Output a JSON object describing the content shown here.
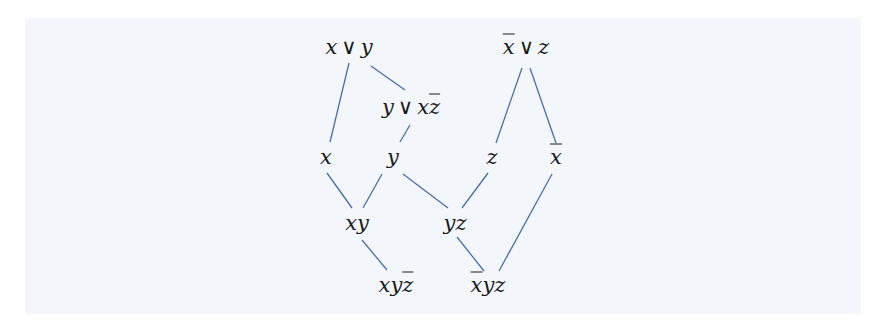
{
  "diagram": {
    "type": "hasse-diagram",
    "background_color": "#f3f7fb",
    "edge_color": "#4a6db0",
    "nodes": [
      {
        "id": "x_or_y",
        "parts": [
          {
            "t": "x"
          },
          {
            "op": "∨"
          },
          {
            "t": "y"
          }
        ],
        "label": "x ∨ y",
        "x": 349,
        "y": 47
      },
      {
        "id": "xbar_or_z",
        "parts": [
          {
            "t": "x",
            "bar": true
          },
          {
            "op": "∨"
          },
          {
            "t": "z"
          }
        ],
        "label": "x̄ ∨ z",
        "x": 526,
        "y": 47
      },
      {
        "id": "y_or_x_zbar",
        "parts": [
          {
            "t": "y"
          },
          {
            "op": "∨"
          },
          {
            "t": "x"
          },
          {
            "t": "z",
            "bar": true
          }
        ],
        "label": "y ∨ x z̄",
        "x": 411,
        "y": 107
      },
      {
        "id": "x",
        "parts": [
          {
            "t": "x"
          }
        ],
        "label": "x",
        "x": 326,
        "y": 157
      },
      {
        "id": "y",
        "parts": [
          {
            "t": "y"
          }
        ],
        "label": "y",
        "x": 393,
        "y": 157
      },
      {
        "id": "z",
        "parts": [
          {
            "t": "z"
          }
        ],
        "label": "z",
        "x": 492,
        "y": 157
      },
      {
        "id": "xbar",
        "parts": [
          {
            "t": "x",
            "bar": true
          }
        ],
        "label": "x̄",
        "x": 556,
        "y": 157
      },
      {
        "id": "xy",
        "parts": [
          {
            "t": "xy"
          }
        ],
        "label": "xy",
        "x": 357,
        "y": 223
      },
      {
        "id": "yz",
        "parts": [
          {
            "t": "yz"
          }
        ],
        "label": "yz",
        "x": 455,
        "y": 223
      },
      {
        "id": "xy_zbar",
        "parts": [
          {
            "t": "xy"
          },
          {
            "t": "z",
            "bar": true
          }
        ],
        "label": "xyz̄",
        "x": 396,
        "y": 285
      },
      {
        "id": "xbar_yz",
        "parts": [
          {
            "t": "x",
            "bar": true
          },
          {
            "t": "yz"
          }
        ],
        "label": "x̄yz",
        "x": 488,
        "y": 285
      }
    ],
    "edges": [
      {
        "from": "x_or_y",
        "to": "x",
        "x1": 349,
        "y1": 63,
        "x2": 330,
        "y2": 142
      },
      {
        "from": "x_or_y",
        "to": "y_or_x_zbar",
        "x1": 371,
        "y1": 66,
        "x2": 405,
        "y2": 90
      },
      {
        "from": "y_or_x_zbar",
        "to": "y",
        "x1": 410,
        "y1": 125,
        "x2": 400,
        "y2": 142
      },
      {
        "from": "xbar_or_z",
        "to": "z",
        "x1": 522,
        "y1": 68,
        "x2": 496,
        "y2": 143
      },
      {
        "from": "xbar_or_z",
        "to": "xbar",
        "x1": 530,
        "y1": 68,
        "x2": 556,
        "y2": 143
      },
      {
        "from": "x",
        "to": "xy",
        "x1": 327,
        "y1": 173,
        "x2": 352,
        "y2": 208
      },
      {
        "from": "y",
        "to": "xy",
        "x1": 382,
        "y1": 174,
        "x2": 363,
        "y2": 208
      },
      {
        "from": "y",
        "to": "yz",
        "x1": 403,
        "y1": 174,
        "x2": 448,
        "y2": 208
      },
      {
        "from": "z",
        "to": "yz",
        "x1": 488,
        "y1": 173,
        "x2": 462,
        "y2": 208
      },
      {
        "from": "xbar",
        "to": "xbar_yz",
        "x1": 552,
        "y1": 174,
        "x2": 499,
        "y2": 271
      },
      {
        "from": "xy",
        "to": "xy_zbar",
        "x1": 362,
        "y1": 240,
        "x2": 387,
        "y2": 270
      },
      {
        "from": "yz",
        "to": "xbar_yz",
        "x1": 457,
        "y1": 237,
        "x2": 484,
        "y2": 271
      }
    ]
  }
}
